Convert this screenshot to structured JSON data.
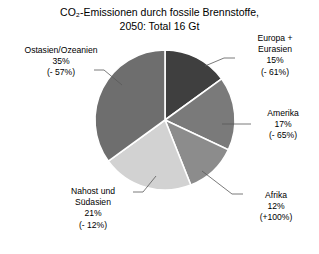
{
  "chart_data": {
    "type": "pie",
    "title": "CO₂-Emissionen durch fossile Brennstoffe,\n2050:  Total 16 Gt",
    "title_line1": "CO₂-Emissionen durch fossile Brennstoffe,",
    "title_line2": "2050:  Total 16 Gt",
    "total_label": "Total 16 Gt",
    "year": "2050",
    "categories": [
      "Europa + Eurasien",
      "Amerika",
      "Afrika",
      "Nahost und Südasien",
      "Ostasien/Ozeanien"
    ],
    "values": [
      15,
      17,
      12,
      21,
      35
    ],
    "value_labels": [
      "15%",
      "17%",
      "12%",
      "21%",
      "35%"
    ],
    "change_labels": [
      "(- 61%)",
      "(- 65%)",
      "(+100%)",
      "(- 12%)",
      "(- 57%)"
    ],
    "colors": [
      "#3f3f3f",
      "#7a7a7a",
      "#8c8c8c",
      "#d2d2d2",
      "#6e6e6e"
    ],
    "slice_border_color": "#ffffff",
    "start_angle_deg": 0,
    "direction": "clockwise",
    "legend": "none",
    "xlabel": "",
    "ylabel": "",
    "slices": [
      {
        "name": "Europa + Eurasien",
        "name_line1": "Europa +",
        "name_line2": "Eurasien",
        "value": 15,
        "value_label": "15%",
        "change_label": "(- 61%)",
        "color": "#3f3f3f"
      },
      {
        "name": "Amerika",
        "name_line1": "Amerika",
        "name_line2": "",
        "value": 17,
        "value_label": "17%",
        "change_label": "(- 65%)",
        "color": "#7a7a7a"
      },
      {
        "name": "Afrika",
        "name_line1": "Afrika",
        "name_line2": "",
        "value": 12,
        "value_label": "12%",
        "change_label": "(+100%)",
        "color": "#8c8c8c"
      },
      {
        "name": "Nahost und Südasien",
        "name_line1": "Nahost und",
        "name_line2": "Südasien",
        "value": 21,
        "value_label": "21%",
        "change_label": "(- 12%)",
        "color": "#d2d2d2"
      },
      {
        "name": "Ostasien/Ozeanien",
        "name_line1": "Ostasien/Ozeanien",
        "name_line2": "",
        "value": 35,
        "value_label": "35%",
        "change_label": "(- 57%)",
        "color": "#6e6e6e"
      }
    ]
  },
  "labels": {
    "europa": "Europa +\nEurasien\n15%\n(- 61%)",
    "amerika": "Amerika\n17%\n(- 65%)",
    "afrika": "Afrika\n12%\n(+100%)",
    "nahost": "Nahost und\nSüdasien\n21%\n(- 12%)",
    "ostasien": "Ostasien/Ozeanien\n35%\n(- 57%)"
  }
}
